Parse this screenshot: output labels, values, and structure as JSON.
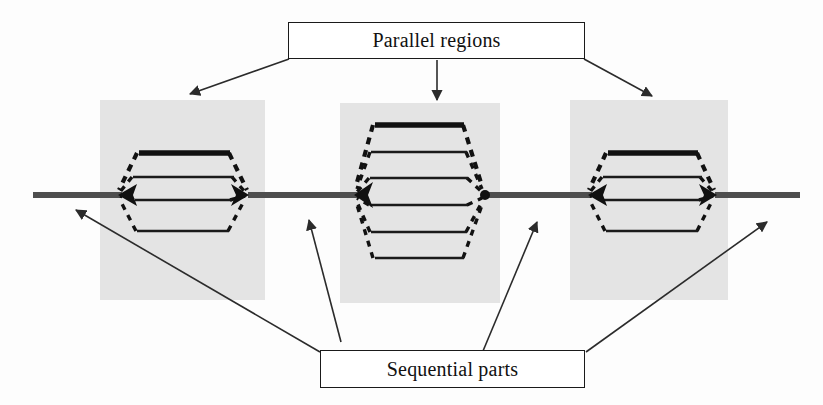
{
  "figure": {
    "title_top": "Parallel regions",
    "title_bottom": "Sequential parts",
    "colors": {
      "region_fill": "#e4e4e4",
      "spine": "#4e4e4e",
      "branch": "#111111",
      "annotation": "#2b2b2b",
      "canvas": "#fdfdfd"
    }
  },
  "labels": {
    "parallel_regions": "Parallel regions",
    "sequential_parts": "Sequential parts"
  },
  "diagram": {
    "spine_y": 195,
    "spine_start_x": 33,
    "spine_end_x": 800,
    "regions": [
      {
        "name": "parallel-region-1",
        "box": {
          "x": 100,
          "y": 100,
          "width": 165,
          "height": 200
        },
        "entry_x": 118,
        "exit_x": 248,
        "branch_count": 4,
        "branches": [
          {
            "y": 153,
            "weight": "thick"
          },
          {
            "y": 177,
            "weight": "thin"
          },
          {
            "y": 200,
            "weight": "thin"
          },
          {
            "y": 231,
            "weight": "thin"
          }
        ]
      },
      {
        "name": "parallel-region-2",
        "box": {
          "x": 340,
          "y": 103,
          "width": 160,
          "height": 200
        },
        "entry_x": 355,
        "exit_x": 485,
        "branch_count": 6,
        "branches": [
          {
            "y": 125,
            "weight": "thick"
          },
          {
            "y": 152,
            "weight": "thin"
          },
          {
            "y": 178,
            "weight": "thin"
          },
          {
            "y": 205,
            "weight": "thin"
          },
          {
            "y": 232,
            "weight": "thin"
          },
          {
            "y": 258,
            "weight": "thin"
          }
        ]
      },
      {
        "name": "parallel-region-3",
        "box": {
          "x": 570,
          "y": 100,
          "width": 158,
          "height": 200
        },
        "entry_x": 588,
        "exit_x": 715,
        "branch_count": 4,
        "branches": [
          {
            "y": 153,
            "weight": "thick"
          },
          {
            "y": 177,
            "weight": "thin"
          },
          {
            "y": 200,
            "weight": "thin"
          },
          {
            "y": 231,
            "weight": "thin"
          }
        ]
      }
    ],
    "annotations": {
      "from_parallel_box": [
        {
          "name": "arrow-to-region-1",
          "x1": 289,
          "y1": 59,
          "x2": 190,
          "y2": 94
        },
        {
          "name": "arrow-to-region-2",
          "x1": 437,
          "y1": 60,
          "x2": 437,
          "y2": 100
        },
        {
          "name": "arrow-to-region-3",
          "x1": 584,
          "y1": 59,
          "x2": 652,
          "y2": 96
        }
      ],
      "from_sequential_box": [
        {
          "name": "arrow-to-sequential-1",
          "x1": 320,
          "y1": 352,
          "x2": 76,
          "y2": 210
        },
        {
          "name": "arrow-to-sequential-2",
          "x1": 341,
          "y1": 342,
          "x2": 309,
          "y2": 220
        },
        {
          "name": "arrow-to-sequential-3",
          "x1": 483,
          "y1": 351,
          "x2": 537,
          "y2": 222
        },
        {
          "name": "arrow-to-sequential-4",
          "x1": 586,
          "y1": 352,
          "x2": 767,
          "y2": 222
        }
      ]
    }
  }
}
